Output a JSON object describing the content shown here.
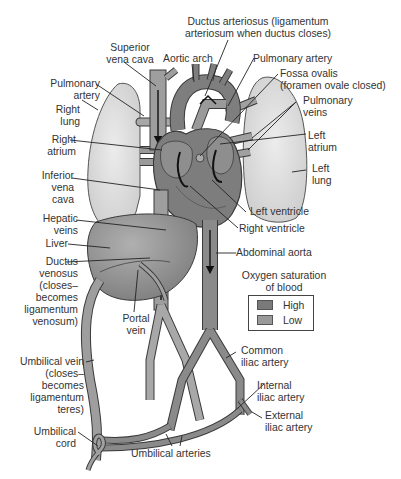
{
  "figure": {
    "colors": {
      "lung_fill": "#d9d9d9",
      "vessel_high": "#8a8a8a",
      "vessel_low": "#9e9e9e",
      "heart_fill": "#7d7d7d",
      "liver_fill": "#8c8c8c",
      "outline": "#3a3a3a"
    }
  },
  "labels": {
    "ductus_arteriosus": [
      "Ductus arteriosus (ligamentum",
      "arteriosum when ductus closes)"
    ],
    "superior_vena_cava": [
      "Superior",
      "vena cava"
    ],
    "aortic_arch": "Aortic arch",
    "pulmonary_artery_left": [
      "Pulmonary",
      "artery"
    ],
    "pulmonary_artery_right": "Pulmonary artery",
    "fossa_ovalis": [
      "Fossa ovalis",
      "(foramen ovale closed)"
    ],
    "right_lung": [
      "Right",
      "lung"
    ],
    "pulmonary_veins": [
      "Pulmonary",
      "veins"
    ],
    "right_atrium": [
      "Right",
      "atrium"
    ],
    "left_atrium": [
      "Left",
      "atrium"
    ],
    "left_lung": [
      "Left",
      "lung"
    ],
    "inferior_vena_cava": [
      "Inferior",
      "vena",
      "cava"
    ],
    "left_ventricle": "Left ventricle",
    "right_ventricle": "Right ventricle",
    "hepatic_veins": [
      "Hepatic",
      "veins"
    ],
    "abdominal_aorta": "Abdominal aorta",
    "liver": "Liver",
    "ductus_venosus": [
      "Ductus",
      "venosus",
      "(closes–",
      "becomes",
      "ligamentum",
      "venosum)"
    ],
    "portal_vein": [
      "Portal",
      "vein"
    ],
    "common_iliac_artery": [
      "Common",
      "iliac artery"
    ],
    "umbilical_vein": [
      "Umbilical vein",
      "(closes–",
      "becomes",
      "ligamentum",
      "teres)"
    ],
    "internal_iliac_artery": [
      "Internal",
      "iliac artery"
    ],
    "external_iliac_artery": [
      "External",
      "iliac artery"
    ],
    "umbilical_cord": [
      "Umbilical",
      "cord"
    ],
    "umbilical_arteries": "Umbilical arteries"
  },
  "legend": {
    "title": [
      "Oxygen saturation",
      "of blood"
    ],
    "items": [
      {
        "label": "High",
        "color": "#7a7a7a"
      },
      {
        "label": "Low",
        "color": "#9a9a9a"
      }
    ]
  }
}
